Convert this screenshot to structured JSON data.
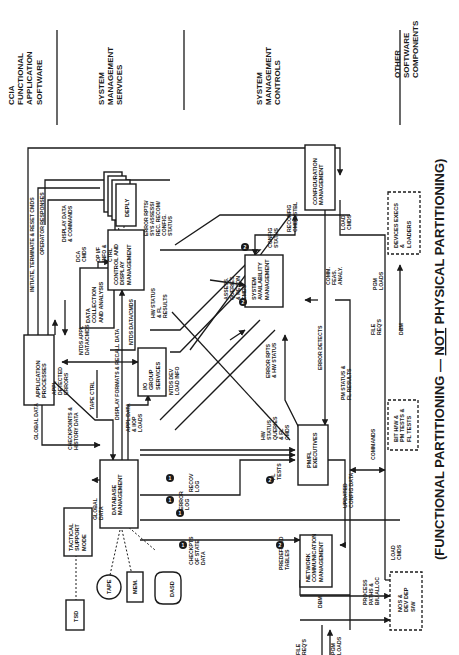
{
  "orientation": "rotated-90-ccw",
  "layers": [
    {
      "id": "ccia",
      "lines": [
        "CCIA",
        "FUNCTIONAL",
        "APPLICATION",
        "SOFTWARE"
      ]
    },
    {
      "id": "sms",
      "lines": [
        "SYSTEM",
        "MANAGEMENT",
        "SERVICES"
      ]
    },
    {
      "id": "smc",
      "lines": [
        "SYSTEM",
        "MANAGEMENT",
        "CONTROLS"
      ]
    },
    {
      "id": "other",
      "lines": [
        "OTHER",
        "SOFTWARE",
        "COMPONENTS"
      ]
    }
  ],
  "caption": {
    "prefix": "(FUNCTIONAL PARTITIONING — ",
    "emphasis": "NOT",
    "suffix": " PHYSICAL PARTITIONING)"
  },
  "boxes": {
    "application_processes": [
      "APPLICATION",
      "PROCESSES"
    ],
    "data_collection": [
      "DATA",
      "COLLECTION",
      "AND ANALYSIS"
    ],
    "control_display": [
      "CONTROL AND",
      "DISPLAY",
      "MANAGEMENT"
    ],
    "deply": [
      "DEPLY"
    ],
    "io_group": [
      "I/O",
      "GROUP",
      "SERVICES"
    ],
    "database_mgmt": [
      "DATABASE",
      "MANAGEMENT"
    ],
    "tactical_support": [
      "TACTICAL",
      "SUPPORT",
      "MODE"
    ],
    "tsd": [
      "TSD"
    ],
    "tape": [
      "TAPE"
    ],
    "mem": [
      "MEM."
    ],
    "dasd": [
      "DASD"
    ],
    "system_availability": [
      "SYSTEM",
      "AVAILABILITY",
      "MANAGEMENT"
    ],
    "configuration_mgmt": [
      "CONFIGURATION",
      "MANAGEMENT"
    ],
    "pmfl_executives": [
      "PM/FL",
      "EXECUTIVES"
    ],
    "network_comm": [
      "NETWORK",
      "COMMUNICATION",
      "MANAGEMENT"
    ],
    "nos": [
      "NOS &",
      "DEV DEP",
      "S/W"
    ],
    "bit_tests": [
      "BIT H/W &",
      "PM TESTS &",
      "FL TESTS"
    ],
    "device_execs": [
      "DEVICES EXECS",
      "&",
      "LOADERS"
    ]
  },
  "labels": {
    "initiate": [
      "INITIATE, TERMINATE & RESET CMDS"
    ],
    "operator_responses": [
      "OPERATOR RESPONSES"
    ],
    "display_data_cmds": [
      "DISPLAY DATA",
      "& COMMANDS"
    ],
    "dca_cmds": [
      "DCA",
      "CMDS"
    ],
    "op_if": [
      "OP I/F",
      "INFO &",
      "CTRL"
    ],
    "error_rpts": [
      "ERROR RPTS/",
      "SYS ASSESS/",
      "REC. RECOM/",
      "CONFIG.",
      "STATUS"
    ],
    "ntds_appl": [
      "NTDS APPL",
      "DATA/CMDS"
    ],
    "appl_detected": [
      "APPL",
      "DETECTED",
      "ERRORS"
    ],
    "tape_ctrl": [
      "TAPE CTRL"
    ],
    "display_formats": [
      "DISPLAY FORMATS & RECALL DATA"
    ],
    "ntds_datacmds": [
      "NTDS DATA/CMDS"
    ],
    "hw_status_fl": [
      "HW STATUS",
      "& FL",
      "RESULTS"
    ],
    "appl_data_loads": [
      "APPL DATA",
      "& I/OP",
      "LOADS"
    ],
    "ntds_dev_load": [
      "NTDS DEV",
      "LOAD INFO"
    ],
    "global_data": [
      "GLOBAL DATA"
    ],
    "checkpoints": [
      "CHECKPOINTS &",
      "HISTORY DATA"
    ],
    "global_data2": [
      "GLOBAL",
      "DATA"
    ],
    "assess_queries": [
      "ASSESS.",
      "QUERIES",
      "& RECON",
      "CMDS"
    ],
    "config_status": [
      "CONFIG",
      "STATUS"
    ],
    "reconfig_cmds": [
      "RECONFIG",
      "CMDS/STBL"
    ],
    "load_cmds": [
      "LOAD",
      "CMDS"
    ],
    "comm_feas": [
      "COMM.",
      "FEAS.",
      "ANALY."
    ],
    "error_detects": [
      "ERROR DETECTS"
    ],
    "error_rpts_hw": [
      "ERROR RPTS",
      "& HW STATUS"
    ],
    "hw_status_queries": [
      "HW",
      "STATUS",
      "QUERIES",
      "& FL",
      "CMDS"
    ],
    "fl_tests": [
      "FL",
      "TESTS"
    ],
    "recov_log": [
      "RECOV",
      "LOG"
    ],
    "error_log": [
      "ERROR",
      "LOG"
    ],
    "checkpts_state": [
      "CHECKPTS",
      "OF STATE",
      "DATA"
    ],
    "predefined_tables": [
      "PREDEFINED",
      "TABLES"
    ],
    "pm_status": [
      "PM STATUS &",
      "FL RESULTS"
    ],
    "commands": [
      "COMMANDS"
    ],
    "updated_config": [
      "UPDATED",
      "CONFIG DATA"
    ],
    "process_paths": [
      "PROCESS",
      "PATHS &",
      "BIU ALLOC"
    ],
    "load_cmds2": [
      "LOAD",
      "CMDS"
    ],
    "file_reqs": [
      "FILE",
      "REQ'S"
    ],
    "pgm_loads": [
      "PGM",
      "LOADS"
    ],
    "dbm": [
      "DBM"
    ],
    "file_reqs2": [
      "FILE",
      "REQ'S"
    ],
    "pgm_loads2": [
      "PGM",
      "LOADS"
    ],
    "dbm2": [
      "DBM"
    ]
  },
  "markers": {
    "one": "1",
    "two": "2"
  },
  "colors": {
    "ink": "#1a1a1a",
    "paper": "#ffffff"
  }
}
